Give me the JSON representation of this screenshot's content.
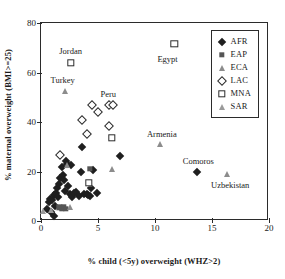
{
  "chart_data": {
    "type": "scatter",
    "title": "",
    "xlabel": "% child (<5y) overweight (WHZ>2)",
    "ylabel": "% maternal overweight (BMI>=25)",
    "xlim": [
      0,
      20
    ],
    "ylim": [
      0,
      80
    ],
    "xticks": [
      0,
      5,
      10,
      15,
      20
    ],
    "yticks": [
      0,
      20,
      40,
      60,
      80
    ],
    "grid": false,
    "legend_position": "top-right",
    "legend": [
      {
        "name": "AFR",
        "marker": "filled-diamond",
        "color": "#1f1f1f"
      },
      {
        "name": "EAP",
        "marker": "filled-square",
        "color": "#555555"
      },
      {
        "name": "ECA",
        "marker": "filled-triangle",
        "color": "#8c8c8c"
      },
      {
        "name": "LAC",
        "marker": "open-diamond",
        "color": "#2b2b2b"
      },
      {
        "name": "MNA",
        "marker": "open-square",
        "color": "#2b2b2b"
      },
      {
        "name": "SAR",
        "marker": "open-triangle",
        "color": "#9a9a9a"
      }
    ],
    "series": [
      {
        "name": "AFR",
        "marker": "filled-diamond",
        "points": [
          {
            "x": 0.5,
            "y": 5.0
          },
          {
            "x": 0.7,
            "y": 7.5
          },
          {
            "x": 0.8,
            "y": 9.0
          },
          {
            "x": 0.9,
            "y": 3.5
          },
          {
            "x": 1.0,
            "y": 8.5
          },
          {
            "x": 1.1,
            "y": 2.2
          },
          {
            "x": 1.1,
            "y": 10.5
          },
          {
            "x": 1.2,
            "y": 6.0
          },
          {
            "x": 1.3,
            "y": 11.5
          },
          {
            "x": 1.4,
            "y": 13.5
          },
          {
            "x": 1.5,
            "y": 9.5
          },
          {
            "x": 1.6,
            "y": 15.0
          },
          {
            "x": 1.7,
            "y": 17.5
          },
          {
            "x": 1.8,
            "y": 21.8
          },
          {
            "x": 1.9,
            "y": 18.5
          },
          {
            "x": 2.0,
            "y": 16.5
          },
          {
            "x": 2.1,
            "y": 12.0
          },
          {
            "x": 2.2,
            "y": 24.2
          },
          {
            "x": 2.3,
            "y": 23.2
          },
          {
            "x": 2.4,
            "y": 14.0
          },
          {
            "x": 2.5,
            "y": 11.0
          },
          {
            "x": 2.6,
            "y": 22.8
          },
          {
            "x": 2.7,
            "y": 9.8
          },
          {
            "x": 2.9,
            "y": 11.2
          },
          {
            "x": 3.1,
            "y": 11.8
          },
          {
            "x": 3.3,
            "y": 10.0
          },
          {
            "x": 3.5,
            "y": 20.0
          },
          {
            "x": 3.6,
            "y": 29.8
          },
          {
            "x": 3.8,
            "y": 11.0
          },
          {
            "x": 4.0,
            "y": 10.8
          },
          {
            "x": 4.1,
            "y": 10.5
          },
          {
            "x": 4.3,
            "y": 10.2
          },
          {
            "x": 4.4,
            "y": 13.5
          },
          {
            "x": 4.6,
            "y": 20.8
          },
          {
            "x": 4.9,
            "y": 11.2
          },
          {
            "x": 6.3,
            "y": 46.8
          },
          {
            "x": 6.9,
            "y": 26.2
          },
          {
            "x": 13.7,
            "y": 19.8
          }
        ]
      },
      {
        "name": "EAP",
        "marker": "filled-square",
        "points": [
          {
            "x": 1.6,
            "y": 5.5
          },
          {
            "x": 1.8,
            "y": 5.2
          },
          {
            "x": 2.0,
            "y": 5.8
          },
          {
            "x": 2.2,
            "y": 5.0
          },
          {
            "x": 4.3,
            "y": 21.2
          }
        ]
      },
      {
        "name": "ECA",
        "marker": "filled-triangle",
        "points": [
          {
            "x": 2.1,
            "y": 52.5
          },
          {
            "x": 2.3,
            "y": 22.5
          },
          {
            "x": 2.5,
            "y": 5.5
          },
          {
            "x": 6.2,
            "y": 21.2
          },
          {
            "x": 10.4,
            "y": 31.0
          },
          {
            "x": 16.3,
            "y": 19.0
          }
        ]
      },
      {
        "name": "LAC",
        "marker": "open-diamond",
        "points": [
          {
            "x": 1.7,
            "y": 26.8
          },
          {
            "x": 3.6,
            "y": 41.0
          },
          {
            "x": 4.0,
            "y": 35.2
          },
          {
            "x": 4.5,
            "y": 47.0
          },
          {
            "x": 5.0,
            "y": 44.0
          },
          {
            "x": 6.0,
            "y": 46.8
          },
          {
            "x": 6.3,
            "y": 47.0
          },
          {
            "x": 6.0,
            "y": 38.2
          }
        ]
      },
      {
        "name": "MNA",
        "marker": "open-square",
        "points": [
          {
            "x": 2.6,
            "y": 64.0
          },
          {
            "x": 4.2,
            "y": 15.5
          },
          {
            "x": 6.2,
            "y": 33.5
          },
          {
            "x": 11.7,
            "y": 71.5
          }
        ]
      },
      {
        "name": "SAR",
        "marker": "open-triangle",
        "points": [
          {
            "x": 0.15,
            "y": 4.2
          },
          {
            "x": 0.9,
            "y": 4.5
          }
        ]
      }
    ],
    "annotations": [
      {
        "text": "Jordan",
        "x": 2.6,
        "y": 68.5
      },
      {
        "text": "Egypt",
        "x": 11.1,
        "y": 65.5
      },
      {
        "text": "Turkey",
        "x": 1.9,
        "y": 57.0
      },
      {
        "text": "Peru",
        "x": 5.9,
        "y": 51.5
      },
      {
        "text": "Armenia",
        "x": 10.6,
        "y": 35.0
      },
      {
        "text": "Comoros",
        "x": 13.8,
        "y": 24.2
      },
      {
        "text": "Uzbekistan",
        "x": 16.6,
        "y": 14.5
      }
    ]
  }
}
